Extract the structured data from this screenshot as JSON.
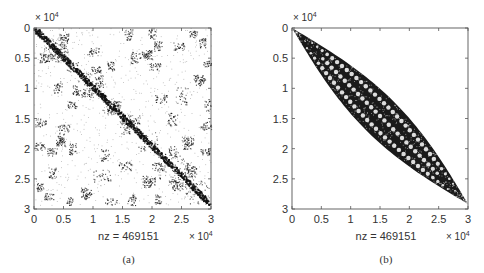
{
  "chart_data": [
    {
      "type": "heatmap",
      "subtype": "sparsity-pattern (spy plot)",
      "caption": "(a)",
      "title": "",
      "xlabel": "nz = 469151",
      "ylabel": "",
      "nz": 469151,
      "matrix_size": 30000,
      "exponent_label": "× 10",
      "exponent": "4",
      "xlim": [
        0,
        3
      ],
      "ylim": [
        0,
        3
      ],
      "y_reversed": true,
      "xticks": [
        "0",
        "0.5",
        "1",
        "1.5",
        "2",
        "2.5",
        "3"
      ],
      "yticks": [
        "0",
        "0.5",
        "1",
        "1.5",
        "2",
        "2.5",
        "3"
      ],
      "grid": false,
      "pattern": "scattered blocks around diagonal (original ordering)",
      "diagonal_blocks": [
        [
          0.0,
          0.15
        ],
        [
          0.15,
          0.55
        ],
        [
          0.55,
          0.75
        ],
        [
          0.75,
          1.15
        ],
        [
          1.15,
          1.45
        ],
        [
          1.45,
          1.75
        ],
        [
          1.75,
          2.1
        ],
        [
          2.1,
          2.55
        ],
        [
          2.55,
          3.0
        ]
      ],
      "offdiag_clusters": [
        [
          0.3,
          0.5,
          0.12
        ],
        [
          0.5,
          0.15,
          0.08
        ],
        [
          1.0,
          0.4,
          0.1
        ],
        [
          1.05,
          0.7,
          0.08
        ],
        [
          0.5,
          1.7,
          0.1
        ],
        [
          0.3,
          2.1,
          0.1
        ],
        [
          0.45,
          1.95,
          0.08
        ],
        [
          1.15,
          2.5,
          0.15
        ],
        [
          1.55,
          2.35,
          0.12
        ],
        [
          2.15,
          1.2,
          0.1
        ],
        [
          1.7,
          1.55,
          0.1
        ],
        [
          2.05,
          0.65,
          0.1
        ],
        [
          2.45,
          0.3,
          0.1
        ],
        [
          2.7,
          0.1,
          0.08
        ],
        [
          2.9,
          1.65,
          0.1
        ],
        [
          2.6,
          1.9,
          0.1
        ],
        [
          2.4,
          2.65,
          0.12
        ],
        [
          1.95,
          2.6,
          0.1
        ],
        [
          0.1,
          1.6,
          0.1
        ],
        [
          0.1,
          2.0,
          0.1
        ],
        [
          0.25,
          2.85,
          0.08
        ],
        [
          0.9,
          2.8,
          0.1
        ],
        [
          1.3,
          2.95,
          0.1
        ],
        [
          2.1,
          2.35,
          0.1
        ],
        [
          1.85,
          0.45,
          0.08
        ],
        [
          2.8,
          0.85,
          0.1
        ],
        [
          2.95,
          0.6,
          0.08
        ],
        [
          0.9,
          1.1,
          0.1
        ],
        [
          1.4,
          1.3,
          0.1
        ],
        [
          0.65,
          1.3,
          0.08
        ],
        [
          2.65,
          2.4,
          0.1
        ],
        [
          2.9,
          2.1,
          0.08
        ]
      ],
      "seed": 7
    },
    {
      "type": "heatmap",
      "subtype": "sparsity-pattern (spy plot)",
      "caption": "(b)",
      "title": "",
      "xlabel": "nz = 469151",
      "ylabel": "",
      "nz": 469151,
      "matrix_size": 30000,
      "exponent_label": "× 10",
      "exponent": "4",
      "xlim": [
        0,
        3
      ],
      "ylim": [
        0,
        3
      ],
      "y_reversed": true,
      "xticks": [
        "0",
        "0.5",
        "1",
        "1.5",
        "2",
        "2.5",
        "3"
      ],
      "yticks": [
        "0",
        "0.5",
        "1",
        "1.5",
        "2",
        "2.5",
        "3"
      ],
      "grid": false,
      "pattern": "banded (reordered, bandwidth peaks ~0.25e4 at middle)",
      "max_half_bandwidth": 0.24,
      "seed": 11
    }
  ]
}
